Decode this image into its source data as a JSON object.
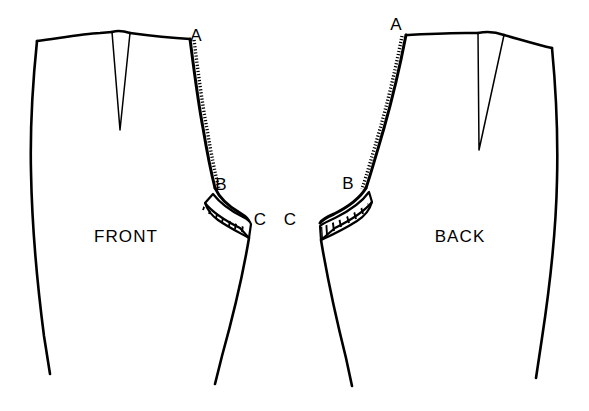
{
  "diagram": {
    "background_color": "#ffffff",
    "ink_color": "#000000",
    "width": 589,
    "height": 411
  },
  "pieces": [
    {
      "id": "front",
      "label": "FRONT",
      "label_x": 126,
      "label_y": 242
    },
    {
      "id": "back",
      "label": "BACK",
      "label_x": 460,
      "label_y": 242
    }
  ],
  "points": [
    {
      "id": "front-a",
      "label": "A",
      "x": 196,
      "y": 41,
      "piece": "front"
    },
    {
      "id": "front-b",
      "label": "B",
      "x": 221,
      "y": 190,
      "piece": "front"
    },
    {
      "id": "front-c",
      "label": "C",
      "x": 260,
      "y": 225,
      "piece": "front"
    },
    {
      "id": "back-c",
      "label": "C",
      "x": 290,
      "y": 225,
      "piece": "back"
    },
    {
      "id": "back-b",
      "label": "B",
      "x": 348,
      "y": 189,
      "piece": "back"
    },
    {
      "id": "back-a",
      "label": "A",
      "x": 396,
      "y": 30,
      "piece": "back"
    }
  ],
  "annotations": {
    "seam_ab_texture": "stippled-beaded-edge",
    "seam_bc_texture": "hatched-crescent-wedge"
  }
}
